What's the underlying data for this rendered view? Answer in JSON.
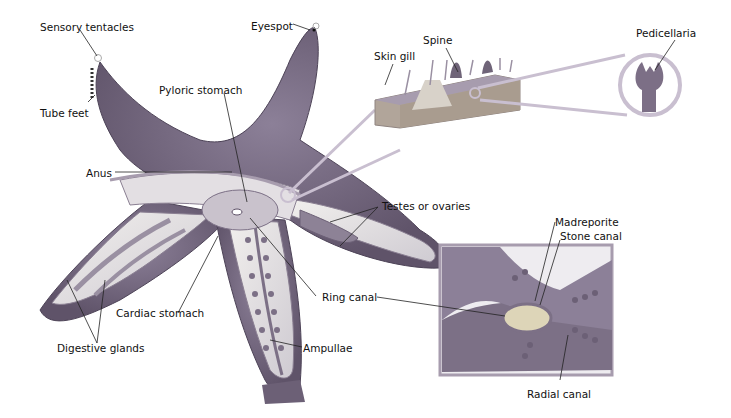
{
  "figure": {
    "colors": {
      "skin": "#7a6d86",
      "skin_dark": "#5e5268",
      "inner": "#e8e6e4",
      "organ": "#8d8296",
      "ring_canal": "#cfc9a8",
      "callout": "#c9bfd0",
      "leader": "#222222"
    }
  },
  "labels": {
    "sensory_tentacles": "Sensory tentacles",
    "tube_feet": "Tube feet",
    "eyespot": "Eyespot",
    "pyloric_stomach": "Pyloric stomach",
    "anus": "Anus",
    "skin_gill": "Skin gill",
    "spine": "Spine",
    "pedicellaria": "Pedicellaria",
    "testes_or_ovaries": "Testes or ovaries",
    "madreporite": "Madreporite",
    "stone_canal": "Stone canal",
    "ring_canal": "Ring canal",
    "cardiac_stomach": "Cardiac stomach",
    "digestive_glands": "Digestive glands",
    "ampullae": "Ampullae",
    "radial_canal": "Radial canal"
  }
}
